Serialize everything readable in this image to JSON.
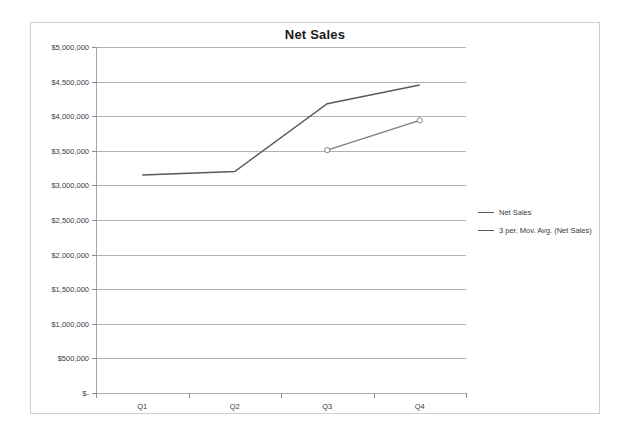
{
  "chart_data": {
    "type": "line",
    "title": "Net Sales",
    "xlabel": "",
    "ylabel": "",
    "categories": [
      "Q1",
      "Q2",
      "Q3",
      "Q4"
    ],
    "ylim": [
      0,
      5000000
    ],
    "ytick_values": [
      5000000,
      4500000,
      4000000,
      3500000,
      3000000,
      2500000,
      2000000,
      1500000,
      1000000,
      500000,
      0
    ],
    "ytick_labels": [
      "$5,000,000",
      "$4,500,000",
      "$4,000,000",
      "$3,500,000",
      "$3,000,000",
      "$2,500,000",
      "$2,000,000",
      "$1,500,000",
      "$1,000,000",
      "$500,000",
      "$-"
    ],
    "grid": true,
    "legend_position": "right",
    "series": [
      {
        "name": "Net Sales",
        "color": "#595959",
        "marker": "none",
        "values": [
          3150000,
          3200000,
          4180000,
          4450000
        ]
      },
      {
        "name": "3 per. Mov. Avg. (Net Sales)",
        "color": "#7f7f7f",
        "marker": "circle",
        "values": [
          null,
          null,
          3510000,
          3940000
        ]
      }
    ]
  },
  "legend": {
    "entries": [
      {
        "label": "Net Sales"
      },
      {
        "label": "3 per. Mov. Avg. (Net Sales)"
      }
    ]
  }
}
